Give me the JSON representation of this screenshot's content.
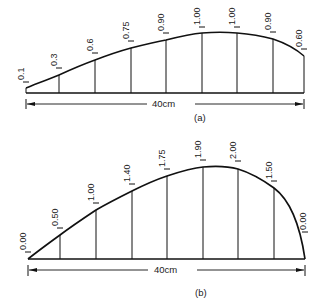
{
  "figure_a": {
    "caption": "(a)",
    "dimension_label": "40cm",
    "station_values": [
      "0.1",
      "0.3",
      "0.6",
      "0.75",
      "0.90",
      "1.00",
      "1.00",
      "0.90",
      "0.60"
    ]
  },
  "figure_b": {
    "caption": "(b)",
    "dimension_label": "40cm",
    "station_values": [
      "0.00",
      "0.50",
      "1.00",
      "1.40",
      "1.75",
      "1.90",
      "2.00",
      "1.50",
      "0.00"
    ]
  }
}
